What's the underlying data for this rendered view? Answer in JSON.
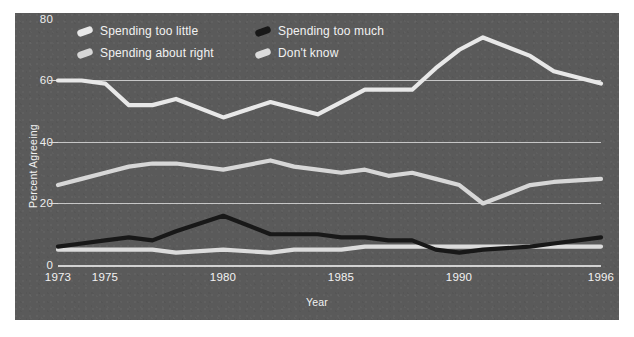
{
  "chart_data": {
    "type": "line",
    "title": "",
    "xlabel": "Year",
    "ylabel": "Percent Agreeing",
    "xlim": [
      1973,
      1996
    ],
    "ylim": [
      0,
      80
    ],
    "yticks": [
      0,
      20,
      40,
      60,
      80
    ],
    "xticks": [
      1973,
      1975,
      1980,
      1985,
      1990,
      1996
    ],
    "grid": true,
    "legend_position": "top-inside",
    "x": [
      1973,
      1974,
      1975,
      1976,
      1977,
      1978,
      1980,
      1982,
      1983,
      1984,
      1985,
      1986,
      1987,
      1988,
      1989,
      1990,
      1991,
      1993,
      1994,
      1996
    ],
    "series": [
      {
        "name": "Spending too little",
        "color": "#e8e8e8",
        "values": [
          60,
          60,
          59,
          52,
          52,
          54,
          48,
          53,
          51,
          49,
          53,
          57,
          57,
          57,
          64,
          70,
          74,
          68,
          63,
          59
        ]
      },
      {
        "name": "Spending about right",
        "color": "#d7d7d7",
        "values": [
          26,
          28,
          30,
          32,
          33,
          33,
          31,
          34,
          32,
          31,
          30,
          31,
          29,
          30,
          28,
          26,
          20,
          26,
          27,
          28
        ]
      },
      {
        "name": "Spending too much",
        "color": "#181818",
        "values": [
          6,
          7,
          8,
          9,
          8,
          11,
          16,
          10,
          10,
          10,
          9,
          9,
          8,
          8,
          5,
          4,
          5,
          6,
          7,
          9
        ]
      },
      {
        "name": "Don't know",
        "color": "#dcdcdc",
        "values": [
          5,
          5,
          5,
          5,
          5,
          4,
          5,
          4,
          5,
          5,
          5,
          6,
          6,
          6,
          6,
          6,
          6,
          6,
          6,
          6
        ]
      }
    ]
  },
  "legend": {
    "items": [
      {
        "label": "Spending too little",
        "swatch": "#e8e8e8",
        "icon": "line-swatch-icon"
      },
      {
        "label": "Spending too much",
        "swatch": "#181818",
        "icon": "line-swatch-icon"
      },
      {
        "label": "Spending about right",
        "swatch": "#d7d7d7",
        "icon": "line-swatch-icon"
      },
      {
        "label": "Don't know",
        "swatch": "#dcdcdc",
        "icon": "line-swatch-icon"
      }
    ]
  },
  "axes": {
    "y_tick_labels": [
      "80",
      "60",
      "40",
      "20",
      "0"
    ],
    "x_tick_labels": [
      "1973",
      "1975",
      "1980",
      "1985",
      "1990",
      "1996"
    ],
    "y_title": "Percent Agreeing",
    "x_title": "Year"
  },
  "style": {
    "panel_bg": "#5a5a5a",
    "grid_color": "#d9d9d9",
    "text_color": "#f2f2f2",
    "page_bg": "#ffffff"
  }
}
